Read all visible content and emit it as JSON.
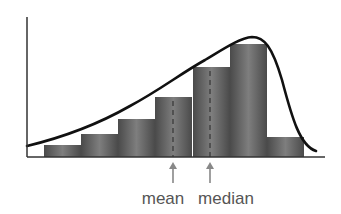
{
  "chart_data": {
    "type": "bar",
    "title": "",
    "xlabel": "",
    "ylabel": "",
    "grid": false,
    "legend": null,
    "categories": [
      "bin1",
      "bin2",
      "bin3",
      "bin4",
      "bin5",
      "bin6",
      "bin7"
    ],
    "values": [
      12,
      23,
      38,
      60,
      90,
      113,
      20
    ],
    "ylim": [
      0,
      140
    ],
    "curve": {
      "name": "density curve",
      "shape": "left-skewed",
      "peak_bin": 6
    },
    "annotations": [
      {
        "label": "mean",
        "position": "bin4 center",
        "style": "dashed line + arrow"
      },
      {
        "label": "median",
        "position": "bin5 center",
        "style": "dashed line + arrow"
      }
    ]
  },
  "labels": {
    "mean": "mean",
    "median": "median"
  },
  "colors": {
    "bar": "#5a5a5a",
    "bar_highlight": "#8a8a8a",
    "curve": "#111111",
    "axis": "#333333",
    "arrow": "#888888",
    "dash": "#3a3a3a"
  },
  "geometry": {
    "origin_x": 27,
    "baseline_y": 157,
    "axis_top_y": 17,
    "axis_right_x": 325,
    "bar_width": 37,
    "bars": [
      {
        "x": 44,
        "top": 145
      },
      {
        "x": 81,
        "top": 134
      },
      {
        "x": 118,
        "top": 119
      },
      {
        "x": 155,
        "top": 97
      },
      {
        "x": 193,
        "top": 67
      },
      {
        "x": 230,
        "top": 44
      },
      {
        "x": 267,
        "top": 137
      }
    ],
    "mean_x": 173,
    "median_x": 210
  }
}
